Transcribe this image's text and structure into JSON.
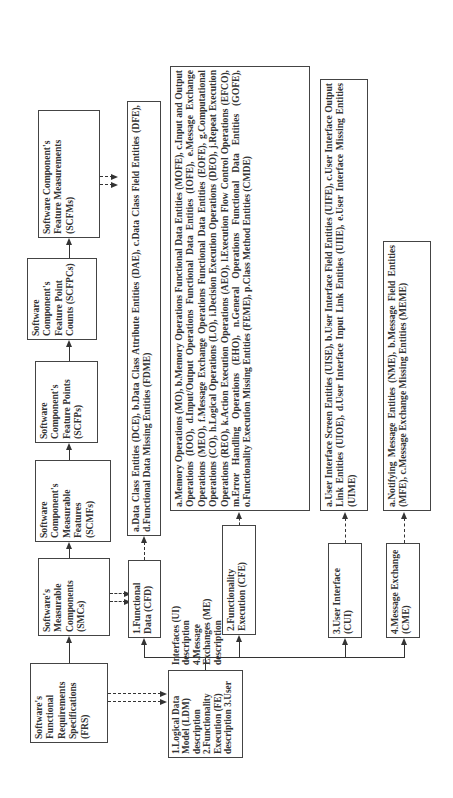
{
  "top_row": {
    "frs": "Software's Functional Requirements Specifications (FRS)",
    "smcs": "Software's Measurable Components (SMCs)",
    "scmfs": "Software Component's Measurable Features (SCMFs)",
    "scfps": "Software Component's Feature Points (SCFPs)",
    "scfpcs": "Software Component's Feature Point Counts (SCFPCs)",
    "scfms": "Software Component's Feature Measurements (SCFMs)"
  },
  "descriptions": {
    "text": "1.Logical Data Model (LDM) description 2.Functionality Execution (FE) description 3.User Interfaces (UI) description 4.Message Exchanges (ME) description"
  },
  "components": [
    {
      "label": "1.Functional Data (CFD)"
    },
    {
      "label": "2.Functionality Execution (CFE)"
    },
    {
      "label": "3.User Interface (CUI)"
    },
    {
      "label": "4.Message Exchange (CME)"
    }
  ],
  "entities": [
    {
      "text": "a.Data Class Entities (DCE), b.Data Class Attribute Entities (DAE), c.Data Class Field Entities (DFE), d.Functional Data Missing Entities (FDME)"
    },
    {
      "text": "a.Memory Operations (MO), b.Memory Operations Functional Data Entities (MOFE), c.Input and Output Operations (IOO), d.Input/Output Operations Functional Data Entities (IOFE), e.Message Exchange Operations (MEO), f.Message Exchange Operations Functional Data Entities (EOFE), g.Computational Operations (CO), h.Logical Operations (LO), i.Decision Execution Operations (DEO), j.Repeat Execution Operations (REO), k.Action Execution Operations (AEO), l.Execution Flow Control Operations (EFCO), m.Error Handling Operations (EHO), n.General Operations Functional Data Entities (GOFE), o.Functionality Execution Missing Entities (FEME), p.Class Method Entities (CMDE)"
    },
    {
      "text": "a.User Interface Screen Entities (UISE), b.User Interface Field Entities (UIFE), c.User Interface Output Link Entities (UIOE), d.User Interface Input Link Entities (UIIE), e.User Interface Missing Entities (UIME)"
    },
    {
      "text": "a.Notifying Message Entities (NME), b.Message Field Entities (MFE), c.Message Exchange Missing Entities (MEME)"
    }
  ]
}
